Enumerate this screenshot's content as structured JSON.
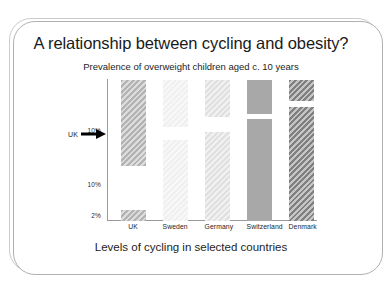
{
  "slide": {
    "title": "A relationship between cycling and obesity?",
    "subtitle": "Prevalence of overweight children aged c. 10 years",
    "caption": "Levels of cycling in selected countries"
  },
  "annotation": {
    "uk_label": "UK",
    "uk_arrow_icon": "arrow-right-icon"
  },
  "chart_data": {
    "type": "bar",
    "title": "Prevalence of overweight children aged c. 10 years",
    "subtitle": "A relationship between cycling and obesity?",
    "xlabel": "Levels of cycling in selected countries",
    "ylabel": "",
    "categories": [
      "UK",
      "Sweden",
      "Germany",
      "Switzerland",
      "Denmark"
    ],
    "values": [
      100,
      82,
      76,
      88,
      92
    ],
    "ytick_labels": [
      "10%",
      "10%",
      "2%"
    ],
    "ytick_positions": [
      0.64,
      0.26,
      0.04
    ],
    "grid": false,
    "legend": false,
    "note": "Each country column is drawn as a tall upper segment and a lower segment separated by a white gap; bar fills are diagonally hatched greys of increasing darkness from Sweden to Denmark.",
    "series": [
      {
        "name": "upper segment",
        "values": [
          0.99,
          0.99,
          0.99,
          0.99,
          0.99
        ]
      },
      {
        "name": "lower segment top",
        "values": [
          0.075,
          0.57,
          0.63,
          0.72,
          0.8
        ]
      }
    ],
    "bars": [
      {
        "category": "UK",
        "color": "#b3b3b3",
        "hatch": true,
        "segments": [
          {
            "top": 0.99,
            "bottom": 0.385
          },
          {
            "top": 0.075,
            "bottom": 0.0
          }
        ]
      },
      {
        "category": "Sweden",
        "color": "#f0f0f0",
        "hatch": true,
        "segments": [
          {
            "top": 0.99,
            "bottom": 0.66
          },
          {
            "top": 0.57,
            "bottom": 0.0
          }
        ]
      },
      {
        "category": "Germany",
        "color": "#e0e0e0",
        "hatch": true,
        "segments": [
          {
            "top": 0.99,
            "bottom": 0.735
          },
          {
            "top": 0.63,
            "bottom": 0.0
          }
        ]
      },
      {
        "category": "Switzerland",
        "color": "#a8a8a8",
        "hatch": false,
        "segments": [
          {
            "top": 0.99,
            "bottom": 0.755
          },
          {
            "top": 0.72,
            "bottom": 0.0
          }
        ]
      },
      {
        "category": "Denmark",
        "color": "#808080",
        "hatch": true,
        "segments": [
          {
            "top": 0.99,
            "bottom": 0.845
          },
          {
            "top": 0.8,
            "bottom": 0.0
          }
        ]
      }
    ]
  }
}
